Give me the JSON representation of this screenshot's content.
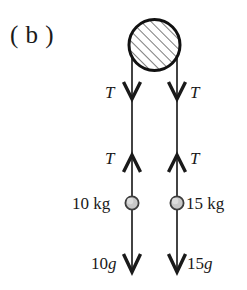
{
  "figure": {
    "panel_label": "( b )",
    "background_color": "#ffffff",
    "stroke_color": "#1a1a1a",
    "pulley": {
      "name": "pulley",
      "fill": "hatched",
      "hatch_angle_deg": 45,
      "center_x": 154.5,
      "center_y": 45,
      "radius": 26,
      "outline_color": "#1a1a1a",
      "hatch_color": "#555555"
    },
    "strings": [
      {
        "side": "left",
        "x": 132,
        "y_top": 45,
        "y_bottom": 272
      },
      {
        "side": "right",
        "x": 177,
        "y_top": 45,
        "y_bottom": 272
      }
    ],
    "arrows": [
      {
        "name": "tension-down-left",
        "x": 132,
        "y": 97,
        "direction": "down",
        "label": "T",
        "label_side": "left"
      },
      {
        "name": "tension-down-right",
        "x": 177,
        "y": 97,
        "direction": "down",
        "label": "T",
        "label_side": "right"
      },
      {
        "name": "tension-up-left",
        "x": 132,
        "y": 158,
        "direction": "up",
        "label": "T",
        "label_side": "left"
      },
      {
        "name": "tension-up-right",
        "x": 177,
        "y": 158,
        "direction": "up",
        "label": "T",
        "label_side": "right"
      },
      {
        "name": "weight-down-left",
        "x": 132,
        "y": 272,
        "direction": "down",
        "label": "10g",
        "label_side": "left"
      },
      {
        "name": "weight-down-right",
        "x": 177,
        "y": 272,
        "direction": "down",
        "label": "15g",
        "label_side": "right"
      }
    ],
    "masses": [
      {
        "name": "mass-left",
        "label": "10 kg",
        "label_side": "left",
        "cx": 132,
        "cy": 203,
        "r": 6.5,
        "fill": "#c9c9c9",
        "outline": "#4a4a4a"
      },
      {
        "name": "mass-right",
        "label": "15 kg",
        "label_side": "right",
        "cx": 177,
        "cy": 203,
        "r": 6.5,
        "fill": "#c9c9c9",
        "outline": "#4a4a4a"
      }
    ],
    "labels": {
      "panel": "( b )",
      "tension_upper_left": "T",
      "tension_upper_right": "T",
      "tension_lower_left": "T",
      "tension_lower_right": "T",
      "mass_left": "10 kg",
      "mass_right": "15 kg",
      "weight_left_num": "10",
      "weight_left_sym": "g",
      "weight_right_num": "15",
      "weight_right_sym": "g"
    }
  }
}
